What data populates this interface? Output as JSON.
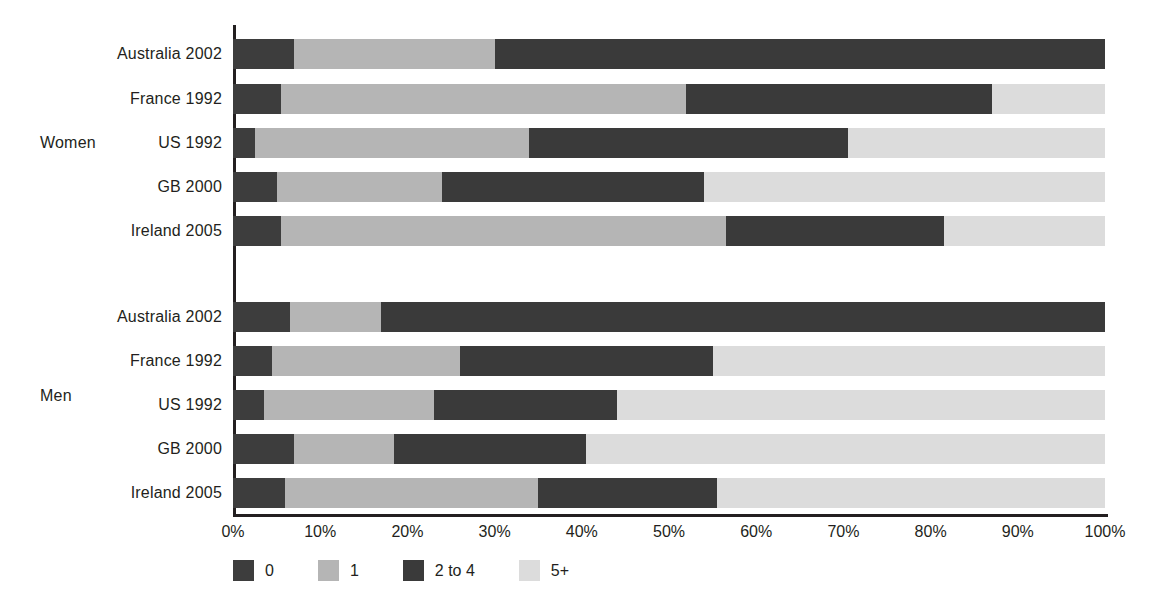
{
  "chart_data": {
    "type": "bar",
    "subtype": "stacked-horizontal-100pct",
    "title": "",
    "xlabel": "",
    "ylabel": "",
    "xlim": [
      0,
      100
    ],
    "xticks": [
      "0%",
      "10%",
      "20%",
      "30%",
      "40%",
      "50%",
      "60%",
      "70%",
      "80%",
      "90%",
      "100%"
    ],
    "grid": false,
    "legend_position": "bottom-left",
    "legend": [
      "0",
      "1",
      "2 to 4",
      "5+"
    ],
    "series_colors": {
      "0": "#3d3d3d",
      "1": "#b5b5b5",
      "2 to 4": "#3a3a3a",
      "5+": "#dcdcdc"
    },
    "groups": [
      {
        "name": "Women",
        "categories": [
          "Australia 2002",
          "France 1992",
          "US 1992",
          "GB 2000",
          "Ireland 2005"
        ],
        "series": [
          {
            "name": "0",
            "values": [
              7.0,
              5.5,
              2.5,
              5.0,
              5.5
            ]
          },
          {
            "name": "1",
            "values": [
              23.0,
              46.5,
              31.5,
              19.0,
              51.0
            ]
          },
          {
            "name": "2 to 4",
            "values": [
              70.0,
              35.0,
              36.5,
              30.0,
              25.0
            ]
          },
          {
            "name": "5+",
            "values": [
              0.0,
              13.0,
              29.5,
              46.0,
              18.5
            ]
          }
        ]
      },
      {
        "name": "Men",
        "categories": [
          "Australia 2002",
          "France 1992",
          "US 1992",
          "GB 2000",
          "Ireland 2005"
        ],
        "series": [
          {
            "name": "0",
            "values": [
              6.5,
              4.5,
              3.5,
              7.0,
              6.0
            ]
          },
          {
            "name": "1",
            "values": [
              10.5,
              21.5,
              19.5,
              11.5,
              29.0
            ]
          },
          {
            "name": "2 to 4",
            "values": [
              83.0,
              29.0,
              21.0,
              22.0,
              20.5
            ]
          },
          {
            "name": "5+",
            "values": [
              0.0,
              45.0,
              56.0,
              59.5,
              44.5
            ]
          }
        ]
      }
    ]
  },
  "axis": {
    "ticks": [
      "0%",
      "10%",
      "20%",
      "30%",
      "40%",
      "50%",
      "60%",
      "70%",
      "80%",
      "90%",
      "100%"
    ]
  },
  "groups": {
    "women_label": "Women",
    "men_label": "Men"
  },
  "rows": {
    "women": [
      {
        "label": "Australia 2002"
      },
      {
        "label": "France 1992"
      },
      {
        "label": "US 1992"
      },
      {
        "label": "GB 2000"
      },
      {
        "label": "Ireland 2005"
      }
    ],
    "men": [
      {
        "label": "Australia 2002"
      },
      {
        "label": "France 1992"
      },
      {
        "label": "US 1992"
      },
      {
        "label": "GB 2000"
      },
      {
        "label": "Ireland 2005"
      }
    ]
  },
  "legend": {
    "items": [
      {
        "label": "0",
        "color": "#3d3d3d"
      },
      {
        "label": "1",
        "color": "#b5b5b5"
      },
      {
        "label": "2 to 4",
        "color": "#3a3a3a"
      },
      {
        "label": "5+",
        "color": "#dcdcdc"
      }
    ]
  }
}
